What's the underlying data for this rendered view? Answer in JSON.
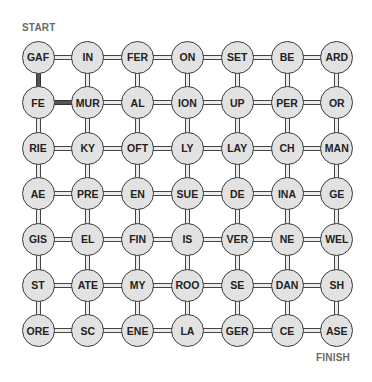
{
  "puzzle": {
    "start_label": "START",
    "finish_label": "FINISH",
    "grid": [
      [
        "GAF",
        "IN",
        "FER",
        "ON",
        "SET",
        "BE",
        "ARD"
      ],
      [
        "FE",
        "MUR",
        "AL",
        "ION",
        "UP",
        "PER",
        "OR"
      ],
      [
        "RIE",
        "KY",
        "OFT",
        "LY",
        "LAY",
        "CH",
        "MAN"
      ],
      [
        "AE",
        "PRE",
        "EN",
        "SUE",
        "DE",
        "INA",
        "GE"
      ],
      [
        "GIS",
        "EL",
        "FIN",
        "IS",
        "VER",
        "NE",
        "WEL"
      ],
      [
        "ST",
        "ATE",
        "MY",
        "ROO",
        "SE",
        "DAN",
        "SH"
      ],
      [
        "ORE",
        "SC",
        "ENE",
        "LA",
        "GER",
        "CE",
        "ASE"
      ]
    ],
    "highlighted_path": [
      {
        "from": [
          0,
          0
        ],
        "to": [
          1,
          0
        ]
      },
      {
        "from": [
          1,
          0
        ],
        "to": [
          1,
          1
        ]
      }
    ],
    "colors": {
      "node_fill": "#e2e2e2",
      "node_border": "#3a3a3a",
      "path_highlight": "#555555",
      "label_color": "#6a6a6a"
    }
  }
}
